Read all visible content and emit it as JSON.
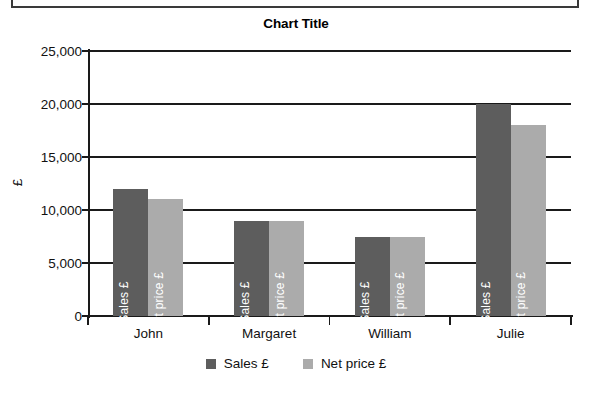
{
  "chart_data": {
    "type": "bar",
    "title": "Chart Title",
    "xlabel": "",
    "ylabel": "£",
    "categories": [
      "John",
      "Margaret",
      "William",
      "Julie"
    ],
    "series": [
      {
        "name": "Sales £",
        "color": "#5d5d5d",
        "values": [
          12000,
          9000,
          7500,
          20000
        ]
      },
      {
        "name": "Net price £",
        "color": "#ababab",
        "values": [
          11000,
          9000,
          7500,
          18000
        ]
      }
    ],
    "ylim": [
      0,
      25000
    ],
    "ytick_values": [
      0,
      5000,
      10000,
      15000,
      20000,
      25000
    ],
    "ytick_labels": [
      "0",
      "5,000",
      "10,000",
      "15,000",
      "20,000",
      "25,000"
    ],
    "grid": true,
    "legend_position": "bottom",
    "bar_inner_labels": true
  },
  "legend": {
    "items": [
      {
        "label": "Sales £",
        "swatch": "series-sales"
      },
      {
        "label": "Net price £",
        "swatch": "series-net"
      }
    ]
  }
}
